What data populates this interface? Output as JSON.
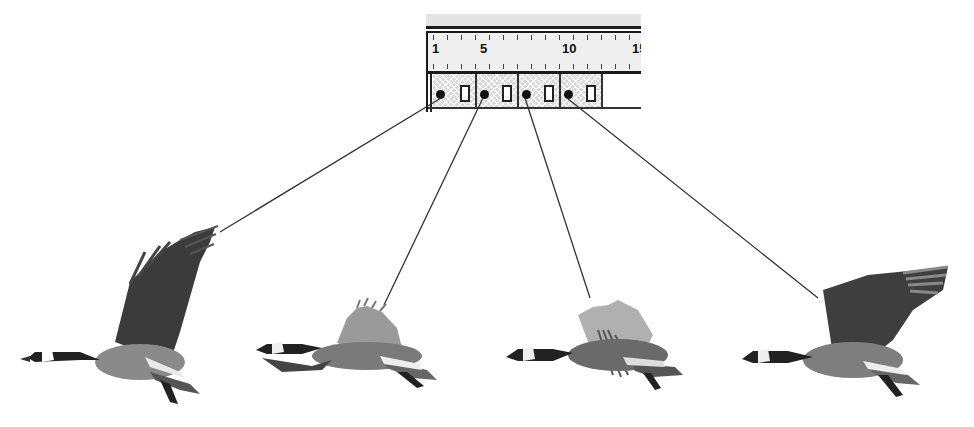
{
  "timeline": {
    "ruler_labels": [
      {
        "text": "1",
        "x": 4
      },
      {
        "text": "5",
        "x": 52
      },
      {
        "text": "10",
        "x": 134
      },
      {
        "text": "15",
        "x": 204
      }
    ],
    "keyframes": [
      {
        "frame": 1,
        "label": "keyframe-1"
      },
      {
        "frame": 4,
        "label": "keyframe-2"
      },
      {
        "frame": 7,
        "label": "keyframe-3"
      },
      {
        "frame": 10,
        "label": "keyframe-4"
      }
    ]
  },
  "geese": [
    {
      "pose": "wings-up",
      "frame": 1
    },
    {
      "pose": "wings-mid-down",
      "frame": 4
    },
    {
      "pose": "wings-down",
      "frame": 7
    },
    {
      "pose": "wings-mid-up",
      "frame": 10
    }
  ],
  "colors": {
    "ink": "#111111",
    "frame_fill": "#d8d8d8",
    "ruler_bg": "#efefef",
    "connector": "#333333"
  }
}
